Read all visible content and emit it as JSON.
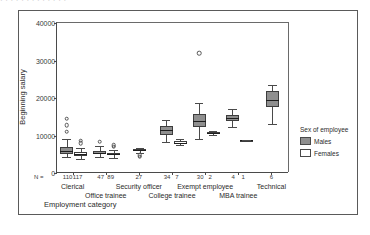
{
  "top_strip": {
    "text": "· · · · ·   · ·    ·   ·    · ·    · ·"
  },
  "axes": {
    "ylabel": "Beginning salary",
    "xlabel": "Employment category",
    "n_prefix": "N ="
  },
  "legend": {
    "title": "Sex of employee",
    "items": [
      {
        "label": "Males",
        "color": "#8f8f8f"
      },
      {
        "label": "Females",
        "color": "#ffffff"
      }
    ]
  },
  "chart_data": {
    "type": "boxplot",
    "title": "",
    "xlabel": "Employment category",
    "ylabel": "Beginning salary",
    "ylim": [
      0,
      40000
    ],
    "yticks": [
      0,
      10000,
      20000,
      30000,
      40000
    ],
    "ytick_labels": [
      "0",
      "10000",
      "20000",
      "30000",
      "40000"
    ],
    "grid": false,
    "legend_position": "right",
    "categories": [
      "Clerical",
      "Office trainee",
      "Security officer",
      "College trainee",
      "Exempt employee",
      "MBA trainee",
      "Technical"
    ],
    "counts": [
      {
        "category": "Clerical",
        "males": 110,
        "females": 117
      },
      {
        "category": "Office trainee",
        "males": 47,
        "females": 89
      },
      {
        "category": "Security officer",
        "males": 27,
        "females": 0
      },
      {
        "category": "College trainee",
        "males": 34,
        "females": 7
      },
      {
        "category": "Exempt employee",
        "males": 30,
        "females": 2
      },
      {
        "category": "MBA trainee",
        "males": 4,
        "females": 1
      },
      {
        "category": "Technical",
        "males": 6,
        "females": 0
      }
    ],
    "series": [
      {
        "name": "Males",
        "color": "#8f8f8f",
        "boxes": [
          {
            "category": "Clerical",
            "whisker_low": 4200,
            "q1": 5200,
            "median": 6000,
            "q3": 6900,
            "whisker_high": 9000,
            "outliers": [
              11000,
              12800,
              14500
            ]
          },
          {
            "category": "Office trainee",
            "whisker_low": 4400,
            "q1": 5000,
            "median": 5400,
            "q3": 6000,
            "whisker_high": 7200,
            "outliers": [
              8400
            ]
          },
          {
            "category": "Security officer",
            "whisker_low": 5400,
            "q1": 5900,
            "median": 6100,
            "q3": 6400,
            "whisker_high": 6700,
            "outliers": [
              4300,
              4700
            ]
          },
          {
            "category": "College trainee",
            "whisker_low": 8400,
            "q1": 10200,
            "median": 11400,
            "q3": 12600,
            "whisker_high": 14200,
            "outliers": []
          },
          {
            "category": "Exempt employee",
            "whisker_low": 9200,
            "q1": 12200,
            "median": 14000,
            "q3": 15800,
            "whisker_high": 18600,
            "outliers": [
              32000
            ]
          },
          {
            "category": "MBA trainee",
            "whisker_low": 12200,
            "q1": 13800,
            "median": 14600,
            "q3": 15600,
            "whisker_high": 17000,
            "outliers": []
          },
          {
            "category": "Technical",
            "whisker_low": 13200,
            "q1": 17600,
            "median": 19600,
            "q3": 22000,
            "whisker_high": 23600,
            "outliers": []
          }
        ]
      },
      {
        "name": "Females",
        "color": "#ffffff",
        "boxes": [
          {
            "category": "Clerical",
            "whisker_low": 3800,
            "q1": 4600,
            "median": 5000,
            "q3": 5600,
            "whisker_high": 6800,
            "outliers": [
              8000,
              8600
            ]
          },
          {
            "category": "Office trainee",
            "whisker_low": 4100,
            "q1": 4700,
            "median": 5000,
            "q3": 5400,
            "whisker_high": 6200,
            "outliers": [
              7000,
              7400
            ]
          },
          {
            "category": "College trainee",
            "whisker_low": 7400,
            "q1": 7800,
            "median": 8100,
            "q3": 8600,
            "whisker_high": 9000,
            "outliers": []
          },
          {
            "category": "Exempt employee",
            "whisker_low": 10200,
            "q1": 10400,
            "median": 10700,
            "q3": 11000,
            "whisker_high": 11200,
            "outliers": []
          },
          {
            "category": "MBA trainee",
            "whisker_low": 8800,
            "q1": 8800,
            "median": 8800,
            "q3": 8800,
            "whisker_high": 8800,
            "outliers": []
          }
        ]
      }
    ]
  }
}
